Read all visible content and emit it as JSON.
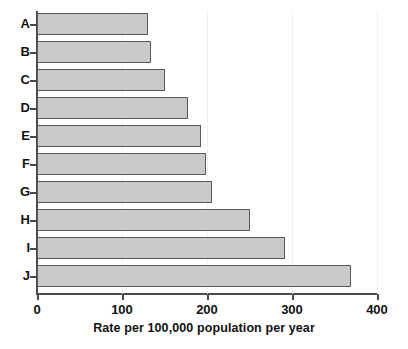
{
  "chart_data": {
    "type": "bar",
    "orientation": "horizontal",
    "title": "",
    "xlabel": "Rate per 100,000 population per year",
    "ylabel": "",
    "categories": [
      "A",
      "B",
      "C",
      "D",
      "E",
      "F",
      "G",
      "H",
      "I",
      "J"
    ],
    "values": [
      130,
      134,
      150,
      178,
      193,
      199,
      206,
      250,
      292,
      369
    ],
    "xlim": [
      0,
      400
    ],
    "xticks": [
      0,
      100,
      200,
      300,
      400
    ],
    "xtick_labels": [
      "0",
      "100",
      "200",
      "300",
      "400"
    ],
    "grid": false,
    "legend": null,
    "series": [
      {
        "name": "Rate",
        "values": [
          130,
          134,
          150,
          178,
          193,
          199,
          206,
          250,
          292,
          369
        ]
      }
    ],
    "bar_fill_color": "#c9c9c9",
    "bar_border_color": "#5a5a5a",
    "axis_color": "#4a4a4a",
    "background_color": "#ffffff"
  }
}
